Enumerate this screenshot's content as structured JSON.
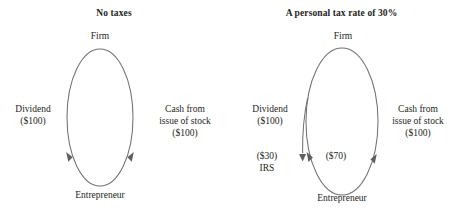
{
  "figure": {
    "type": "flow-diagram",
    "background_color": "#ffffff",
    "stroke_color": "#6f7176",
    "text_color": "#231f20",
    "panels": [
      {
        "id": "no-taxes",
        "title": "No taxes",
        "nodes": {
          "top": "Firm",
          "bottom": "Entrepreneur"
        },
        "edges": {
          "left_label_line1": "Dividend",
          "left_label_line2": "($100)",
          "right_label_line1": "Cash from",
          "right_label_line2": "issue of stock",
          "right_label_line3": "($100)"
        }
      },
      {
        "id": "personal-tax-30",
        "title": "A personal tax rate of 30%",
        "nodes": {
          "top": "Firm",
          "bottom": "Entrepreneur",
          "tax_authority": "IRS"
        },
        "edges": {
          "left_label_line1": "Dividend",
          "left_label_line2": "($100)",
          "right_label_line1": "Cash from",
          "right_label_line2": "issue of stock",
          "right_label_line3": "($100)",
          "tax_amount": "($30)",
          "net_amount": "($70)"
        }
      }
    ]
  }
}
